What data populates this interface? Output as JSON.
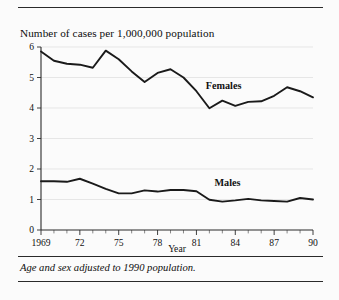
{
  "figure": {
    "title": "Number of cases per 1,000,000 population",
    "footnote": "Age and sex adjusted to 1990 population.",
    "rule_top_name": "top-rule",
    "rule_mid_name": "mid-rule",
    "rule_bottom_name": "bottom-rule"
  },
  "chart_data": {
    "type": "line",
    "title": "Number of cases per 1,000,000 population",
    "subtitle": "",
    "xlabel": "Year",
    "ylabel": "",
    "xlim": [
      1969,
      1990
    ],
    "ylim": [
      0,
      6
    ],
    "grid": true,
    "grid_axis": "y",
    "legend_position": "inline-annotation",
    "x": [
      1969,
      1970,
      1971,
      1972,
      1973,
      1974,
      1975,
      1976,
      1977,
      1978,
      1979,
      1980,
      1981,
      1982,
      1983,
      1984,
      1985,
      1986,
      1987,
      1988,
      1989,
      1990
    ],
    "xticks": [
      1969,
      1972,
      1975,
      1978,
      1981,
      1984,
      1987,
      1990
    ],
    "xticklabels": [
      "1969",
      "72",
      "75",
      "78",
      "81",
      "84",
      "87",
      "90"
    ],
    "yticks": [
      0,
      1,
      2,
      3,
      4,
      5,
      6
    ],
    "yticklabels": [
      "0",
      "1",
      "2",
      "3",
      "4",
      "5",
      "6"
    ],
    "series": [
      {
        "name": "Females",
        "label": "Females",
        "color": "#1a1a1a",
        "values": [
          5.85,
          5.55,
          5.45,
          5.42,
          5.32,
          5.88,
          5.6,
          5.2,
          4.85,
          5.15,
          5.27,
          5.0,
          4.55,
          3.99,
          4.24,
          4.07,
          4.2,
          4.22,
          4.4,
          4.68,
          4.55,
          4.35
        ]
      },
      {
        "name": "Males",
        "label": "Males",
        "color": "#1a1a1a",
        "values": [
          1.6,
          1.6,
          1.58,
          1.68,
          1.52,
          1.35,
          1.2,
          1.2,
          1.3,
          1.26,
          1.31,
          1.31,
          1.27,
          0.99,
          0.93,
          0.97,
          1.02,
          0.97,
          0.95,
          0.93,
          1.05,
          1.0
        ]
      }
    ],
    "annotations": [
      {
        "text": "Females",
        "x": 1983.1,
        "y": 4.63
      },
      {
        "text": "Males",
        "x": 1983.4,
        "y": 1.43
      }
    ]
  }
}
